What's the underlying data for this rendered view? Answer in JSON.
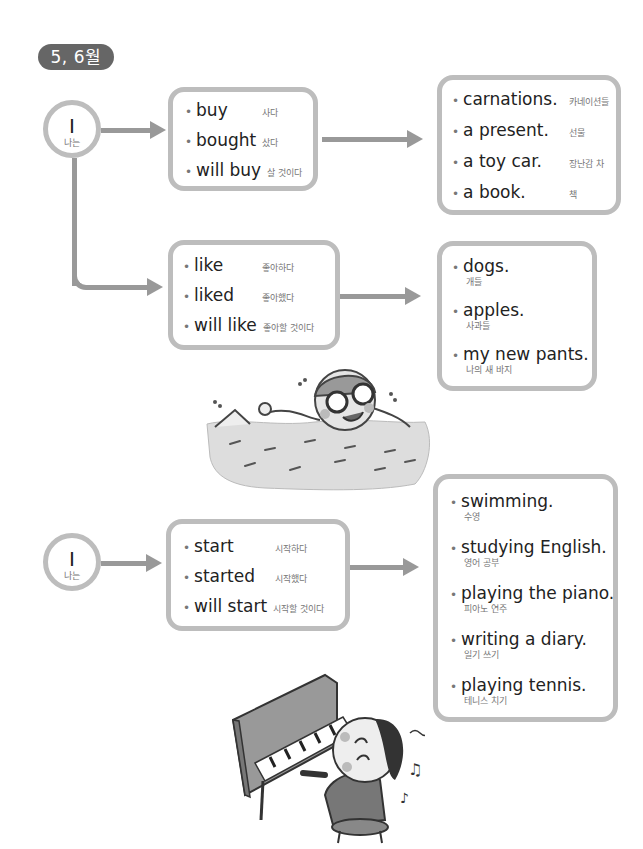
{
  "header": {
    "badge": "5, 6월"
  },
  "section1": {
    "subject": {
      "en": "I",
      "ko": "나는"
    },
    "verbs_buy": [
      {
        "en": "buy",
        "ko": "사다"
      },
      {
        "en": "bought",
        "ko": "샀다"
      },
      {
        "en": "will buy",
        "ko": "살 것이다"
      }
    ],
    "objects_buy": [
      {
        "en": "carnations.",
        "ko": "카네이션들"
      },
      {
        "en": "a present.",
        "ko": "선물"
      },
      {
        "en": "a toy car.",
        "ko": "장난감 차"
      },
      {
        "en": "a book.",
        "ko": "책"
      }
    ],
    "verbs_like": [
      {
        "en": "like",
        "ko": "좋아하다"
      },
      {
        "en": "liked",
        "ko": "좋아했다"
      },
      {
        "en": "will like",
        "ko": "좋아할 것이다"
      }
    ],
    "objects_like": [
      {
        "en": "dogs.",
        "ko": "개들"
      },
      {
        "en": "apples.",
        "ko": "사과들"
      },
      {
        "en": "my new pants.",
        "ko": "나의 새 바지"
      }
    ]
  },
  "section2": {
    "subject": {
      "en": "I",
      "ko": "나는"
    },
    "verbs_start": [
      {
        "en": "start",
        "ko": "시작하다"
      },
      {
        "en": "started",
        "ko": "시작했다"
      },
      {
        "en": "will start",
        "ko": "시작할 것이다"
      }
    ],
    "objects_start": [
      {
        "en": "swimming.",
        "ko": "수영"
      },
      {
        "en": "studying English.",
        "ko": "영어 공부"
      },
      {
        "en": "playing the piano.",
        "ko": "피아노 연주"
      },
      {
        "en": "writing a diary.",
        "ko": "일기 쓰기"
      },
      {
        "en": "playing tennis.",
        "ko": "테니스 치기"
      }
    ]
  },
  "illustrations": {
    "swimmer": "swimming-child-illustration",
    "pianist": "piano-playing-child-illustration"
  },
  "colors": {
    "badge": "#666666",
    "border": "#bdbdbd",
    "arrow": "#999999",
    "text": "#222222",
    "subtext": "#777777"
  }
}
